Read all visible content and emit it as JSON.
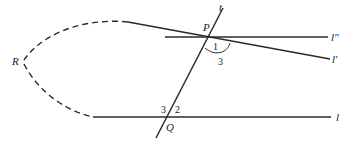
{
  "diagram": {
    "colors": {
      "line": "#2a2a2a",
      "background": "#ffffff"
    },
    "points": {
      "P": {
        "label": "P"
      },
      "Q": {
        "label": "Q"
      },
      "R": {
        "label": "R"
      }
    },
    "lines": {
      "t": {
        "label": "t"
      },
      "l": {
        "label": "l"
      },
      "l_prime": {
        "label": "l′"
      },
      "l_double_prime": {
        "label": "l″"
      }
    },
    "angles": {
      "angle_1": {
        "label": "1"
      },
      "angle_2": {
        "label": "2"
      },
      "angle_3_at_P": {
        "label": "3"
      },
      "angle_3_at_Q": {
        "label": "3"
      }
    }
  }
}
